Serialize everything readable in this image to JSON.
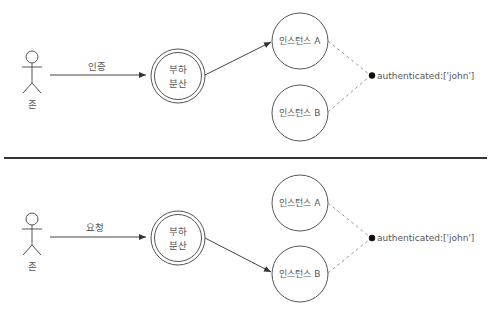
{
  "colors": {
    "stroke": "#555555",
    "text": "#555555",
    "divider": "#333333",
    "dot": "#111111",
    "dashed": "#999999"
  },
  "panels": [
    {
      "actor": {
        "label": "존"
      },
      "edge_label": "인증",
      "load_balancer": {
        "line1": "부하",
        "line2": "분산"
      },
      "routed_to": "A",
      "instances": [
        {
          "label": "인스턴스 A"
        },
        {
          "label": "인스턴스 B"
        }
      ],
      "session": {
        "label": "authenticated:['john']"
      }
    },
    {
      "actor": {
        "label": "존"
      },
      "edge_label": "요청",
      "load_balancer": {
        "line1": "부하",
        "line2": "분산"
      },
      "routed_to": "B",
      "instances": [
        {
          "label": "인스턴스 A"
        },
        {
          "label": "인스턴스 B"
        }
      ],
      "session": {
        "label": "authenticated:['john']"
      }
    }
  ]
}
